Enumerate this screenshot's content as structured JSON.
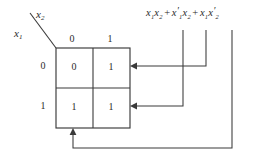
{
  "diagram": {
    "type": "karnaugh-map",
    "line_color": "#3a3a3a",
    "text_color": "#2b2b2b",
    "background": "#ffffff"
  },
  "axis": {
    "column_variable": "x",
    "column_variable_sub": "2",
    "row_variable": "x",
    "row_variable_sub": "1",
    "column_headers": [
      "0",
      "1"
    ],
    "row_headers": [
      "0",
      "1"
    ]
  },
  "map": {
    "rows": [
      {
        "row_label": "0",
        "cells": [
          "0",
          "1"
        ]
      },
      {
        "row_label": "1",
        "cells": [
          "1",
          "1"
        ]
      }
    ]
  },
  "expression": {
    "full_text": "x1x2 + x1'x2 + x1x2'",
    "terms": [
      {
        "id": "term-1",
        "literals": [
          {
            "var": "x",
            "sub": "1",
            "prime": false
          },
          {
            "var": "x",
            "sub": "2",
            "prime": false
          }
        ]
      },
      {
        "id": "term-2",
        "literals": [
          {
            "var": "x",
            "sub": "1",
            "prime": true
          },
          {
            "var": "x",
            "sub": "2",
            "prime": false
          }
        ]
      },
      {
        "id": "term-3",
        "literals": [
          {
            "var": "x",
            "sub": "1",
            "prime": false
          },
          {
            "var": "x",
            "sub": "2",
            "prime": true
          }
        ]
      }
    ],
    "operator": "+"
  },
  "pointers": [
    {
      "id": "pointer-term-1",
      "from_term": "term-1",
      "to_cell": "row0-col1",
      "arrow_direction": "left"
    },
    {
      "id": "pointer-term-2",
      "from_term": "term-2",
      "to_cell": "row1-col1",
      "arrow_direction": "left"
    },
    {
      "id": "pointer-term-3",
      "from_term": "term-3",
      "to_cell": "row1-col0",
      "arrow_direction": "up"
    }
  ]
}
